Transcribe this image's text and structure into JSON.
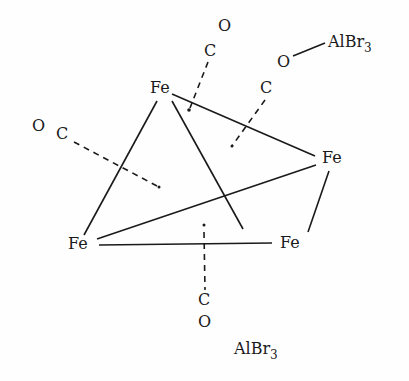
{
  "diagram": {
    "atoms": {
      "fe_top": "Fe",
      "fe_right": "Fe",
      "fe_left": "Fe",
      "fe_bottom": "Fe"
    },
    "carbonyls": {
      "top_c": "C",
      "top_o": "O",
      "right_c": "C",
      "right_o": "O",
      "left_c": "C",
      "left_o": "O",
      "bottom_c": "C",
      "bottom_o": "O"
    },
    "lewis_acid_top": {
      "base": "AlBr",
      "sub": "3"
    },
    "lewis_acid_bottom": {
      "base": "AlBr",
      "sub": "3"
    },
    "colors": {
      "ink": "#1a1a1a",
      "background": "#fefefe"
    }
  }
}
